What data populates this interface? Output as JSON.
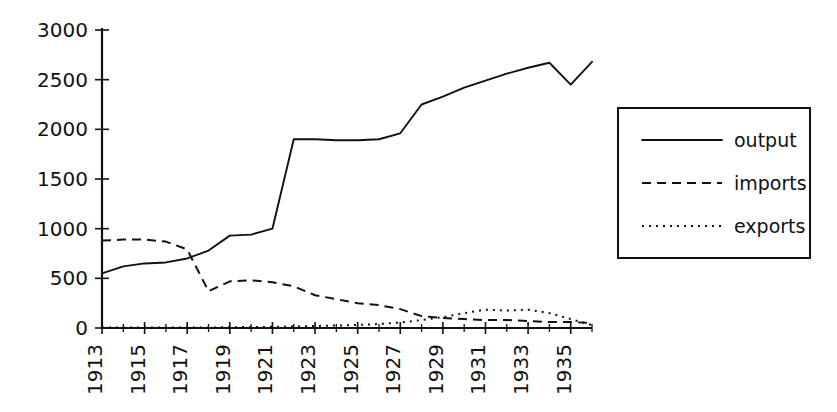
{
  "chart_data": {
    "type": "line",
    "title": "",
    "subtitle": "",
    "xlabel": "",
    "ylabel": "",
    "xlim": [
      1913,
      1936
    ],
    "ylim": [
      0,
      3000
    ],
    "grid": false,
    "legend_position": "right",
    "x": [
      1913,
      1914,
      1915,
      1916,
      1917,
      1918,
      1919,
      1920,
      1921,
      1922,
      1923,
      1924,
      1925,
      1926,
      1927,
      1928,
      1929,
      1930,
      1931,
      1932,
      1933,
      1934,
      1935,
      1936
    ],
    "y_ticks": [
      0,
      500,
      1000,
      1500,
      2000,
      2500,
      3000
    ],
    "y_tick_labels": [
      "0",
      "500",
      "1000",
      "1500",
      "2000",
      "2500",
      "3000"
    ],
    "x_tick_labels": [
      "1913",
      "1915",
      "1917",
      "1919",
      "1921",
      "1923",
      "1925",
      "1927",
      "1929",
      "1931",
      "1933",
      "1935"
    ],
    "x_tick_values": [
      1913,
      1915,
      1917,
      1919,
      1921,
      1923,
      1925,
      1927,
      1929,
      1931,
      1933,
      1935
    ],
    "series": [
      {
        "name": "output",
        "style": "solid",
        "color": "#111111",
        "values": [
          550,
          620,
          650,
          660,
          700,
          780,
          930,
          940,
          1000,
          1900,
          1900,
          1890,
          1890,
          1900,
          1960,
          2250,
          2330,
          2420,
          2490,
          2560,
          2620,
          2670,
          2450,
          2680
        ]
      },
      {
        "name": "imports",
        "style": "dashed",
        "color": "#111111",
        "values": [
          880,
          890,
          890,
          870,
          790,
          370,
          470,
          480,
          460,
          420,
          330,
          290,
          250,
          230,
          190,
          120,
          100,
          90,
          80,
          80,
          70,
          60,
          60,
          50
        ]
      },
      {
        "name": "exports",
        "style": "dotted",
        "color": "#111111",
        "values": [
          5,
          5,
          5,
          5,
          5,
          5,
          8,
          10,
          12,
          15,
          20,
          25,
          30,
          40,
          55,
          80,
          110,
          150,
          185,
          175,
          185,
          150,
          90,
          30
        ]
      }
    ]
  },
  "legend": {
    "items": [
      {
        "label": "output",
        "style": "solid"
      },
      {
        "label": "imports",
        "style": "dashed"
      },
      {
        "label": "exports",
        "style": "dotted"
      }
    ]
  }
}
